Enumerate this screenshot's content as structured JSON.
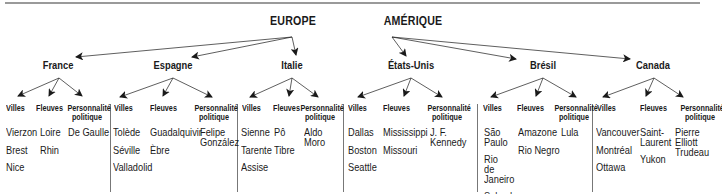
{
  "continents": [
    {
      "name": "EUROPE",
      "x": 293,
      "countries": [
        {
          "name": "France",
          "x": 58,
          "columns": [
            {
              "header": "Villes",
              "items": [
                "Vierzon",
                "Brest",
                "Nice"
              ]
            },
            {
              "header": "Fleuves",
              "items": [
                "Loire",
                "Rhin"
              ]
            },
            {
              "header": "Personnalité politique",
              "items": [
                "De Gaulle"
              ]
            }
          ]
        },
        {
          "name": "Espagne",
          "x": 173,
          "columns": [
            {
              "header": "Villes",
              "items": [
                "Tolède",
                "Séville",
                "Valladolid"
              ]
            },
            {
              "header": "Fleuves",
              "items": [
                "Guadalquivir",
                "Èbre"
              ]
            },
            {
              "header": "Personnalité politique",
              "items": [
                "Felipe González"
              ]
            }
          ]
        },
        {
          "name": "Italie",
          "x": 292,
          "columns": [
            {
              "header": "Villes",
              "items": [
                "Sienne",
                "Tarente",
                "Assise"
              ]
            },
            {
              "header": "Fleuves",
              "items": [
                "Pô",
                "Tibre"
              ]
            },
            {
              "header": "Personnalité politique",
              "items": [
                "Aldo Moro"
              ]
            }
          ]
        }
      ]
    },
    {
      "name": "AMÉRIQUE",
      "x": 413,
      "countries": [
        {
          "name": "États-Unis",
          "x": 411,
          "columns": [
            {
              "header": "Villes",
              "items": [
                "Dallas",
                "Boston",
                "Seattle"
              ]
            },
            {
              "header": "Fleuves",
              "items": [
                "Mississippi",
                "Missouri"
              ]
            },
            {
              "header": "Personnalité politique",
              "items": [
                "J. F. Kennedy"
              ]
            }
          ]
        },
        {
          "name": "Brésil",
          "x": 543,
          "columns": [
            {
              "header": "Villes",
              "items": [
                "São Paulo",
                "Rio de Janeiro",
                "Salvador"
              ]
            },
            {
              "header": "Fleuves",
              "items": [
                "Amazone",
                "Rio Negro"
              ]
            },
            {
              "header": "Personnalité politique",
              "items": [
                "Lula"
              ]
            }
          ]
        },
        {
          "name": "Canada",
          "x": 653,
          "columns": [
            {
              "header": "Villes",
              "items": [
                "Vancouver",
                "Montréal",
                "Ottawa"
              ]
            },
            {
              "header": "Fleuves",
              "items": [
                "Saint-Laurent",
                "Yukon"
              ]
            },
            {
              "header": "Personnalité politique",
              "items": [
                "Pierre Elliott Trudeau"
              ]
            }
          ]
        }
      ]
    }
  ],
  "colors": {
    "text": "#1a1a1a",
    "rule": "#9a9a9a",
    "separator": "#777777",
    "arrow": "#1a1a1a"
  }
}
